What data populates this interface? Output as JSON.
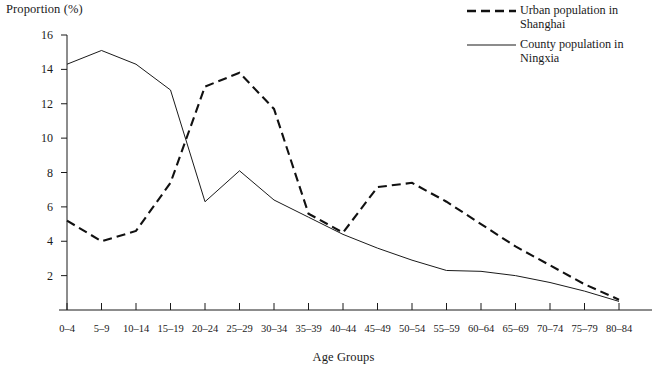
{
  "chart_data": {
    "type": "line",
    "title": "",
    "xlabel": "Age Groups",
    "ylabel": "Proportion (%)",
    "categories": [
      "0–4",
      "5–9",
      "10–14",
      "15–19",
      "20–24",
      "25–29",
      "30–34",
      "35–39",
      "40–44",
      "45–49",
      "50–54",
      "55–59",
      "60–64",
      "65–69",
      "70–74",
      "75–79",
      "80–84"
    ],
    "ylim": [
      0,
      16
    ],
    "yticks": [
      2,
      4,
      6,
      8,
      10,
      12,
      14,
      16
    ],
    "grid": false,
    "legend_position": "top-right",
    "series": [
      {
        "name": "Urban population in Shanghai",
        "style": "dashed",
        "color": "#111111",
        "values": [
          5.2,
          4.0,
          4.6,
          7.4,
          13.0,
          13.8,
          11.7,
          5.6,
          4.5,
          7.15,
          7.4,
          6.3,
          5.0,
          3.7,
          2.6,
          1.5,
          0.6
        ]
      },
      {
        "name": "County population in Ningxia",
        "style": "solid",
        "color": "#1a1a1a",
        "values": [
          14.3,
          15.1,
          14.3,
          12.8,
          6.3,
          8.1,
          6.4,
          5.4,
          4.4,
          3.6,
          2.9,
          2.3,
          2.25,
          2.0,
          1.6,
          1.1,
          0.5
        ]
      }
    ]
  },
  "axes": {
    "y_title": "Proportion (%)",
    "x_title": "Age Groups",
    "y_tick_labels": [
      "16",
      "14",
      "12",
      "10",
      "8",
      "6",
      "4",
      "2"
    ],
    "x_tick_labels": [
      "0–4",
      "5–9",
      "10–14",
      "15–19",
      "20–24",
      "25–29",
      "30–34",
      "35–39",
      "40–44",
      "45–49",
      "50–54",
      "55–59",
      "60–64",
      "65–69",
      "70–74",
      "75–79",
      "80–84"
    ]
  },
  "legend": {
    "items": [
      {
        "label_line1": "Urban population in",
        "label_line2": "Shanghai",
        "style": "dashed"
      },
      {
        "label_line1": "County population in",
        "label_line2": "Ningxia",
        "style": "solid"
      }
    ]
  }
}
